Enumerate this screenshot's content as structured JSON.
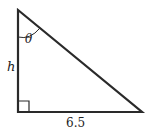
{
  "diagram": {
    "type": "right-triangle",
    "labels": {
      "angle": "θ",
      "height": "h",
      "base": "6.5"
    },
    "colors": {
      "stroke": "#2a2a2a",
      "text": "#222222"
    }
  }
}
